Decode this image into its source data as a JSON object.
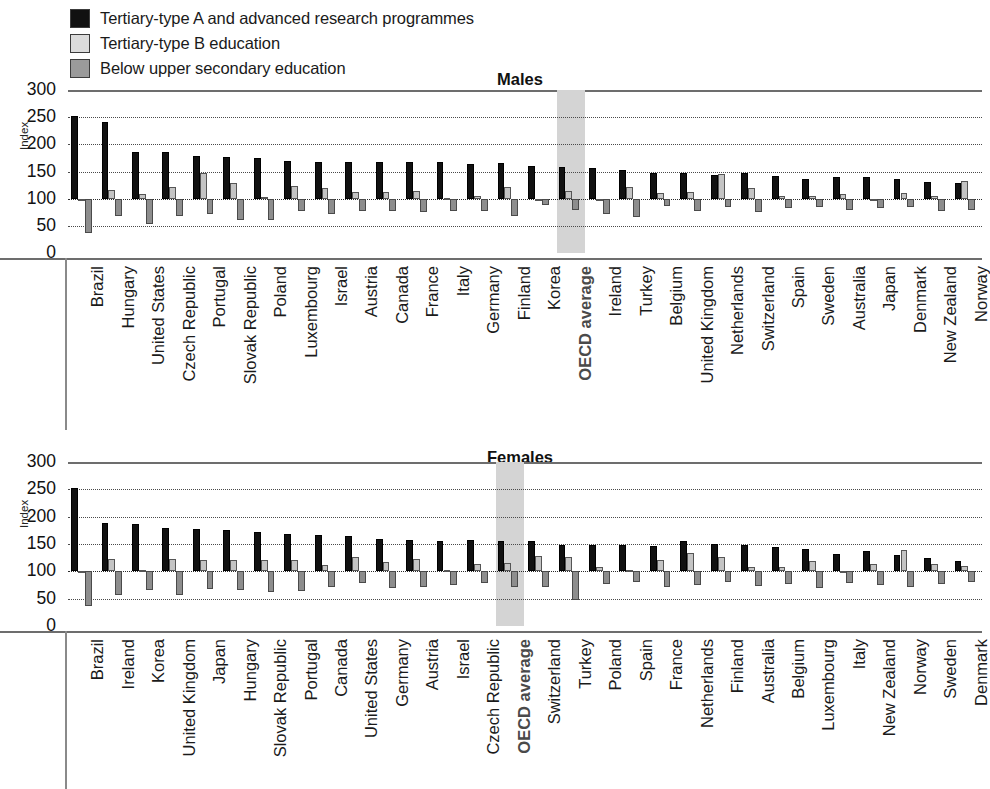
{
  "legend": {
    "items": [
      {
        "label": "Tertiary-type A and advanced research programmes",
        "swatch": "#111111",
        "icon": "legend-swatch-black"
      },
      {
        "label": "Tertiary-type B education",
        "swatch": "#dcdcdc",
        "icon": "legend-swatch-light-gray"
      },
      {
        "label": "Below upper secondary education",
        "swatch": "#9a9a9a",
        "icon": "legend-swatch-dark-gray"
      }
    ]
  },
  "colors": {
    "tertiary_a": "#111111",
    "tertiary_b": "#c4c4c4",
    "below_upper_secondary": "#8d8d8d",
    "highlight_band": "#d4d4d4",
    "axis": "#6d6d6d",
    "grid": "#4a4a4a"
  },
  "axis": {
    "ylabel": "Index",
    "ticks": [
      "300",
      "250",
      "200",
      "150",
      "100",
      "50",
      "0"
    ],
    "ymin": 0,
    "ymax": 300,
    "baseline": 100,
    "gridlines": [
      250,
      200,
      150,
      100,
      50
    ]
  },
  "chart_data": [
    {
      "type": "bar",
      "title": "Males",
      "xlabel": "",
      "ylabel": "Index",
      "ylim": [
        0,
        300
      ],
      "baseline": 100,
      "grid": true,
      "legend_position": "top-left",
      "highlight_category": "OECD average",
      "categories": [
        "Brazil",
        "Hungary",
        "United States",
        "Czech Republic",
        "Portugal",
        "Slovak Republic",
        "Poland",
        "Luxembourg",
        "Israel",
        "Austria",
        "Canada",
        "France",
        "Italy",
        "Germany",
        "Finland",
        "Korea",
        "OECD average",
        "Ireland",
        "Turkey",
        "Belgium",
        "United Kingdom",
        "Netherlands",
        "Switzerland",
        "Spain",
        "Sweden",
        "Australia",
        "Japan",
        "Denmark",
        "New Zealand",
        "Norway"
      ],
      "series": [
        {
          "name": "Tertiary-type A and advanced research programmes",
          "color": "#111111",
          "values": [
            253,
            242,
            186,
            186,
            179,
            176,
            175,
            170,
            168,
            168,
            168,
            167,
            167,
            164,
            165,
            160,
            158,
            156,
            153,
            148,
            148,
            144,
            147,
            141,
            136,
            140,
            139,
            136,
            131,
            129
          ]
        },
        {
          "name": "Tertiary-type B education",
          "color": "#c4c4c4",
          "values": [
            100,
            116,
            108,
            122,
            147,
            128,
            103,
            124,
            119,
            112,
            112,
            114,
            101,
            105,
            122,
            100,
            115,
            100,
            121,
            111,
            113,
            146,
            120,
            104,
            104,
            109,
            100,
            110,
            105,
            133
          ]
        },
        {
          "name": "Below upper secondary education",
          "color": "#8d8d8d",
          "values": [
            36,
            68,
            54,
            68,
            71,
            60,
            61,
            77,
            72,
            78,
            77,
            76,
            78,
            77,
            68,
            88,
            80,
            71,
            66,
            87,
            78,
            84,
            76,
            83,
            84,
            80,
            82,
            84,
            78,
            79
          ]
        }
      ]
    },
    {
      "type": "bar",
      "title": "Females",
      "xlabel": "",
      "ylabel": "Index",
      "ylim": [
        0,
        300
      ],
      "baseline": 100,
      "grid": true,
      "legend_position": "top-left",
      "highlight_category": "OECD average",
      "categories": [
        "Brazil",
        "Ireland",
        "Korea",
        "United Kingdom",
        "Japan",
        "Hungary",
        "Slovak Republic",
        "Portugal",
        "Canada",
        "United States",
        "Germany",
        "Austria",
        "Israel",
        "Czech Republic",
        "OECD average",
        "Switzerland",
        "Turkey",
        "Poland",
        "Spain",
        "France",
        "Netherlands",
        "Finland",
        "Australia",
        "Belgium",
        "Luxembourg",
        "Italy",
        "New Zealand",
        "Norway",
        "Sweden",
        "Denmark"
      ],
      "series": [
        {
          "name": "Tertiary-type A and advanced research programmes",
          "color": "#111111",
          "values": [
            253,
            188,
            186,
            180,
            177,
            175,
            172,
            168,
            166,
            165,
            160,
            158,
            155,
            157,
            156,
            155,
            148,
            148,
            148,
            147,
            156,
            150,
            148,
            144,
            141,
            132,
            137,
            129,
            125,
            118
          ]
        },
        {
          "name": "Tertiary-type B education",
          "color": "#c4c4c4",
          "values": [
            100,
            123,
            102,
            122,
            121,
            120,
            120,
            120,
            111,
            127,
            117,
            122,
            102,
            114,
            116,
            128,
            127,
            108,
            103,
            121,
            134,
            126,
            108,
            108,
            119,
            100,
            113,
            139,
            113,
            109
          ]
        },
        {
          "name": "Below upper secondary education",
          "color": "#8d8d8d",
          "values": [
            36,
            56,
            65,
            57,
            68,
            66,
            63,
            64,
            72,
            79,
            70,
            71,
            75,
            78,
            72,
            72,
            47,
            76,
            81,
            72,
            75,
            80,
            73,
            76,
            70,
            79,
            75,
            72,
            76,
            80
          ]
        }
      ]
    }
  ]
}
